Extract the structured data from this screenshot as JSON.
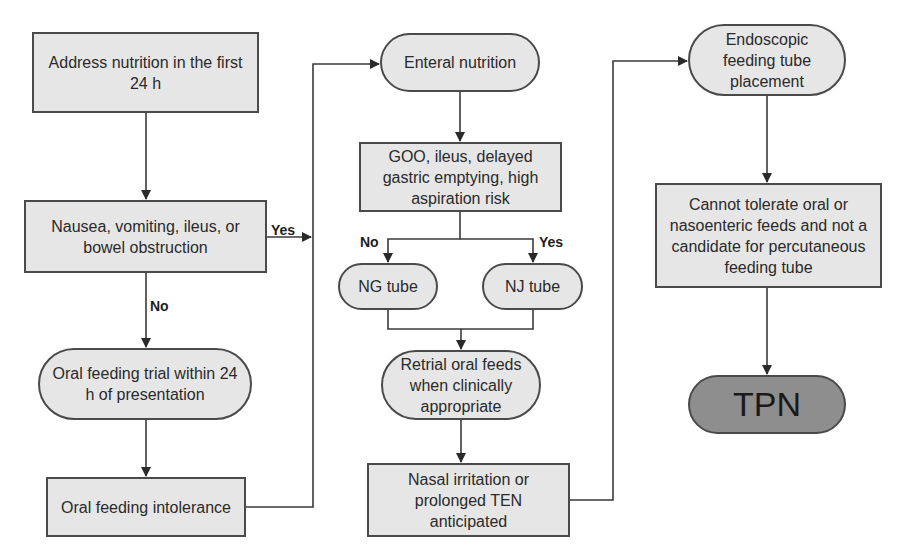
{
  "diagram": {
    "type": "flowchart",
    "colors": {
      "node_fill": "#e6e6e6",
      "terminal_fill": "#8e8e8e",
      "stroke": "#4a4a4a"
    },
    "nodes": {
      "address": "Address nutrition in the first 24 h",
      "nausea": "Nausea, vomiting, ileus, or bowel obstruction",
      "oral_trial": "Oral feeding trial within 24 h of presentation",
      "oral_intolerance": "Oral feeding intolerance",
      "enteral": "Enteral nutrition",
      "goo": "GOO, ileus, delayed gastric emptying, high aspiration risk",
      "ng_tube": "NG tube",
      "nj_tube": "NJ tube",
      "retrial": "Retrial oral feeds when clinically appropriate",
      "nasal": "Nasal irritation or prolonged TEN anticipated",
      "endoscopic": "Endoscopic feeding tube placement",
      "cannot": "Cannot tolerate oral or nasoenteric feeds and not a candidate for percutaneous feeding tube",
      "tpn": "TPN"
    },
    "edge_labels": {
      "nausea_yes": "Yes",
      "nausea_no": "No",
      "goo_no": "No",
      "goo_yes": "Yes"
    }
  }
}
